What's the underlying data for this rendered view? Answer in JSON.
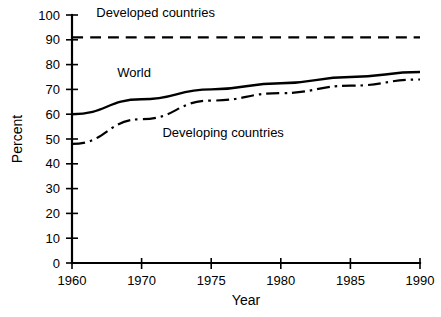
{
  "chart_data": {
    "type": "line",
    "title": "",
    "xlabel": "Year",
    "ylabel": "Percent",
    "ylim": [
      0,
      100
    ],
    "ytick_labels": [
      "0",
      "10",
      "20",
      "30",
      "40",
      "50",
      "60",
      "70",
      "80",
      "90",
      "100"
    ],
    "ytick_values": [
      0,
      10,
      20,
      30,
      40,
      50,
      60,
      70,
      80,
      90,
      100
    ],
    "xtick_labels": [
      "1960",
      "1970",
      "1975",
      "1980",
      "1985",
      "1990"
    ],
    "x": [
      1960,
      1970,
      1975,
      1980,
      1985,
      1990
    ],
    "x_axis_note": "non-linear spacing: 1960 to 1970 occupies one interval, then 5-year intervals",
    "grid": false,
    "legend": "inline annotations on plot",
    "series": [
      {
        "name": "Developed countries",
        "style": "dashed",
        "color": "#000000",
        "values": [
          91,
          91,
          91,
          91,
          91,
          91
        ]
      },
      {
        "name": "World",
        "style": "solid",
        "color": "#000000",
        "values": [
          60,
          66,
          70,
          72.5,
          75,
          77
        ]
      },
      {
        "name": "Developing countries",
        "style": "dash-dot",
        "color": "#000000",
        "values": [
          48,
          58,
          65.5,
          68.5,
          71.5,
          74
        ]
      }
    ],
    "annotations": [
      {
        "text": "Developed countries",
        "x": 1963.5,
        "y": 99
      },
      {
        "text": "World",
        "x": 1966.5,
        "y": 75
      },
      {
        "text": "Developing countries",
        "x": 1971.5,
        "y": 51
      }
    ]
  },
  "colors": {
    "axis": "#000000",
    "background": "#ffffff",
    "series": "#000000"
  }
}
